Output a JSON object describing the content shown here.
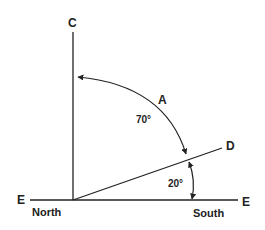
{
  "diagram": {
    "labels": {
      "top": "C",
      "left_end": "E",
      "right_end": "E",
      "ray_end": "D",
      "arc": "A",
      "north": "North",
      "south": "South"
    },
    "angles": {
      "large": "70°",
      "small": "20°"
    },
    "colors": {
      "line": "#222222",
      "background": "#ffffff"
    }
  }
}
